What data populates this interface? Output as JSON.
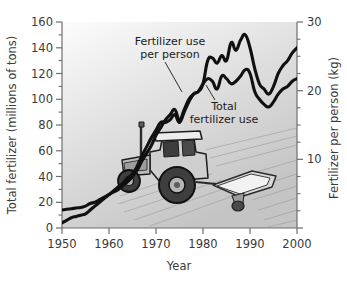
{
  "figure": {
    "background_color": "#ffffff",
    "plot_gradient_from": "#fbfbfb",
    "plot_gradient_to": "#c9c9c9",
    "series_color": "#101010",
    "axis_color": "#6e6e6e",
    "text_color": "#3a3a3a"
  },
  "chart_data": {
    "type": "line",
    "title": "",
    "xlabel": "Year",
    "ylabel": "Total fertilizer (millions of tons)",
    "ylabel_right": "Fertilizer per person (kg)",
    "xlim": [
      1950,
      2000
    ],
    "ylim": [
      0,
      160
    ],
    "ylim_right": [
      0,
      30
    ],
    "grid": false,
    "legend_position": "inline-annotations",
    "xticks": [
      1950,
      1960,
      1970,
      1980,
      1990,
      2000
    ],
    "xtick_labels": [
      "1950",
      "1960",
      "1970",
      "1980",
      "1990",
      "2000"
    ],
    "yticks": [
      0,
      20,
      40,
      60,
      80,
      100,
      120,
      140,
      160
    ],
    "ytick_labels": [
      "0",
      "20",
      "40",
      "60",
      "80",
      "100",
      "120",
      "140",
      "160"
    ],
    "yticks_minor": [
      10,
      30,
      50,
      70,
      90,
      110,
      130,
      150
    ],
    "yticks_right": [
      10,
      20,
      30
    ],
    "ytick_labels_right": [
      "10",
      "20",
      "30"
    ],
    "yticks_right_minor": [
      2.5,
      5,
      7.5,
      12.5,
      15,
      17.5,
      22.5,
      25,
      27.5
    ],
    "annotations": [
      {
        "name": "fertilizer-use-per-person",
        "line1": "Fertilizer use",
        "line2": "per person"
      },
      {
        "name": "total-fertilizer-use",
        "line1": "Total",
        "line2": "fertilizer use"
      }
    ],
    "x": [
      1950,
      1951,
      1952,
      1953,
      1954,
      1955,
      1956,
      1957,
      1958,
      1959,
      1960,
      1961,
      1962,
      1963,
      1964,
      1965,
      1966,
      1967,
      1968,
      1969,
      1970,
      1971,
      1972,
      1973,
      1974,
      1975,
      1976,
      1977,
      1978,
      1979,
      1980,
      1981,
      1982,
      1983,
      1984,
      1985,
      1986,
      1987,
      1988,
      1989,
      1990,
      1991,
      1992,
      1993,
      1994,
      1995,
      1996,
      1997,
      1998,
      1999,
      2000
    ],
    "series": [
      {
        "name": "Fertilizer use per person",
        "axis": "right",
        "units": "kg",
        "values_left_scale": [
          14,
          14.5,
          15,
          15.5,
          16,
          17,
          19,
          20,
          22,
          24,
          26,
          28,
          30,
          33,
          36,
          40,
          45,
          52,
          58,
          64,
          72,
          78,
          84,
          88,
          92,
          84,
          92,
          100,
          104,
          106,
          112,
          130,
          132,
          128,
          134,
          130,
          144,
          138,
          146,
          150,
          140,
          124,
          112,
          108,
          104,
          110,
          120,
          126,
          130,
          136,
          140
        ],
        "values": [
          2.6,
          2.7,
          2.8,
          2.9,
          3.0,
          3.2,
          3.6,
          3.8,
          4.1,
          4.5,
          4.9,
          5.3,
          5.6,
          6.2,
          6.8,
          7.5,
          8.4,
          9.8,
          10.9,
          12.0,
          13.5,
          14.6,
          15.8,
          16.5,
          17.3,
          15.8,
          17.3,
          18.8,
          19.5,
          19.9,
          21.0,
          24.4,
          24.8,
          24.0,
          25.1,
          24.4,
          27.0,
          25.9,
          27.4,
          28.1,
          26.3,
          23.3,
          21.0,
          20.3,
          19.5,
          20.6,
          22.5,
          23.6,
          24.4,
          25.5,
          26.3
        ]
      },
      {
        "name": "Total fertilizer use",
        "axis": "left",
        "units": "millions of tons",
        "values": [
          4,
          6,
          8,
          9,
          10,
          11,
          14,
          17,
          20,
          23,
          26,
          29,
          32,
          35,
          39,
          42,
          48,
          56,
          63,
          70,
          76,
          82,
          82,
          84,
          88,
          82,
          90,
          98,
          104,
          106,
          112,
          116,
          114,
          108,
          118,
          116,
          112,
          114,
          118,
          123,
          120,
          106,
          100,
          96,
          94,
          98,
          104,
          108,
          110,
          114,
          116
        ]
      }
    ]
  },
  "illustration": {
    "name": "tractor-with-fertilizer-spreader",
    "description": "tractor pulling a fertilizer spreader over a field"
  }
}
